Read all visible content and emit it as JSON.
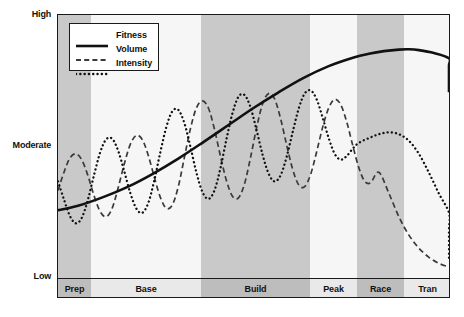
{
  "chart_data": {
    "type": "line",
    "title": "",
    "xlabel": "",
    "ylabel": "",
    "grid": false,
    "legend_position": "top-left",
    "y_ticks": [
      "High",
      "Moderate",
      "Low"
    ],
    "y_tick_positions": [
      1.0,
      0.5,
      0.0
    ],
    "ylim": [
      0,
      1
    ],
    "categories": [
      "Prep",
      "Base",
      "Build",
      "Peak",
      "Race",
      "Tran"
    ],
    "category_spans": [
      [
        0,
        33
      ],
      [
        33,
        143
      ],
      [
        143,
        252
      ],
      [
        252,
        299
      ],
      [
        299,
        346
      ],
      [
        346,
        393
      ]
    ],
    "category_shading": [
      "dark",
      "light",
      "dark",
      "light",
      "dark",
      "light"
    ],
    "series": [
      {
        "name": "Fitness",
        "style": "solid",
        "points": [
          [
            0,
            0.255
          ],
          [
            20,
            0.272
          ],
          [
            45,
            0.305
          ],
          [
            70,
            0.345
          ],
          [
            95,
            0.395
          ],
          [
            120,
            0.452
          ],
          [
            145,
            0.515
          ],
          [
            170,
            0.58
          ],
          [
            195,
            0.645
          ],
          [
            220,
            0.705
          ],
          [
            245,
            0.76
          ],
          [
            270,
            0.805
          ],
          [
            295,
            0.838
          ],
          [
            310,
            0.852
          ],
          [
            325,
            0.862
          ],
          [
            340,
            0.868
          ],
          [
            350,
            0.869
          ],
          [
            360,
            0.866
          ],
          [
            375,
            0.855
          ],
          [
            390,
            0.835
          ],
          [
            405,
            0.808
          ],
          [
            420,
            0.775
          ],
          [
            435,
            0.74
          ],
          [
            450,
            0.705
          ]
        ]
      },
      {
        "name": "Volume",
        "style": "dashed",
        "points": [
          [
            0,
            0.33
          ],
          [
            6,
            0.4
          ],
          [
            12,
            0.455
          ],
          [
            18,
            0.47
          ],
          [
            24,
            0.445
          ],
          [
            30,
            0.385
          ],
          [
            36,
            0.31
          ],
          [
            42,
            0.25
          ],
          [
            48,
            0.23
          ],
          [
            54,
            0.262
          ],
          [
            60,
            0.34
          ],
          [
            66,
            0.43
          ],
          [
            72,
            0.505
          ],
          [
            78,
            0.54
          ],
          [
            84,
            0.525
          ],
          [
            90,
            0.465
          ],
          [
            96,
            0.382
          ],
          [
            102,
            0.305
          ],
          [
            108,
            0.262
          ],
          [
            114,
            0.275
          ],
          [
            120,
            0.345
          ],
          [
            126,
            0.455
          ],
          [
            132,
            0.565
          ],
          [
            138,
            0.645
          ],
          [
            144,
            0.672
          ],
          [
            150,
            0.645
          ],
          [
            156,
            0.565
          ],
          [
            162,
            0.462
          ],
          [
            168,
            0.368
          ],
          [
            174,
            0.308
          ],
          [
            180,
            0.302
          ],
          [
            186,
            0.355
          ],
          [
            192,
            0.455
          ],
          [
            198,
            0.568
          ],
          [
            204,
            0.66
          ],
          [
            210,
            0.7
          ],
          [
            216,
            0.68
          ],
          [
            222,
            0.605
          ],
          [
            228,
            0.505
          ],
          [
            234,
            0.412
          ],
          [
            240,
            0.352
          ],
          [
            246,
            0.345
          ],
          [
            252,
            0.392
          ],
          [
            258,
            0.478
          ],
          [
            264,
            0.572
          ],
          [
            270,
            0.645
          ],
          [
            276,
            0.678
          ],
          [
            282,
            0.658
          ],
          [
            288,
            0.592
          ],
          [
            294,
            0.502
          ],
          [
            300,
            0.418
          ],
          [
            306,
            0.365
          ],
          [
            312,
            0.36
          ],
          [
            320,
            0.4
          ],
          [
            330,
            0.32
          ],
          [
            340,
            0.23
          ],
          [
            350,
            0.16
          ],
          [
            360,
            0.11
          ],
          [
            370,
            0.075
          ],
          [
            380,
            0.052
          ],
          [
            390,
            0.038
          ]
        ]
      },
      {
        "name": "Intensity",
        "style": "dotted",
        "points": [
          [
            0,
            0.365
          ],
          [
            6,
            0.295
          ],
          [
            12,
            0.232
          ],
          [
            18,
            0.205
          ],
          [
            24,
            0.228
          ],
          [
            30,
            0.298
          ],
          [
            36,
            0.39
          ],
          [
            42,
            0.475
          ],
          [
            48,
            0.525
          ],
          [
            54,
            0.528
          ],
          [
            60,
            0.482
          ],
          [
            66,
            0.405
          ],
          [
            72,
            0.322
          ],
          [
            78,
            0.262
          ],
          [
            84,
            0.245
          ],
          [
            90,
            0.282
          ],
          [
            96,
            0.368
          ],
          [
            102,
            0.475
          ],
          [
            108,
            0.572
          ],
          [
            114,
            0.632
          ],
          [
            120,
            0.638
          ],
          [
            126,
            0.588
          ],
          [
            132,
            0.498
          ],
          [
            138,
            0.4
          ],
          [
            144,
            0.325
          ],
          [
            150,
            0.298
          ],
          [
            156,
            0.33
          ],
          [
            162,
            0.415
          ],
          [
            168,
            0.525
          ],
          [
            174,
            0.625
          ],
          [
            180,
            0.688
          ],
          [
            186,
            0.695
          ],
          [
            192,
            0.648
          ],
          [
            198,
            0.562
          ],
          [
            204,
            0.468
          ],
          [
            210,
            0.395
          ],
          [
            216,
            0.365
          ],
          [
            222,
            0.388
          ],
          [
            228,
            0.458
          ],
          [
            234,
            0.552
          ],
          [
            240,
            0.642
          ],
          [
            246,
            0.7
          ],
          [
            252,
            0.712
          ],
          [
            258,
            0.678
          ],
          [
            264,
            0.608
          ],
          [
            270,
            0.53
          ],
          [
            276,
            0.47
          ],
          [
            282,
            0.448
          ],
          [
            288,
            0.462
          ],
          [
            294,
            0.49
          ],
          [
            300,
            0.512
          ],
          [
            310,
            0.53
          ],
          [
            320,
            0.545
          ],
          [
            330,
            0.552
          ],
          [
            340,
            0.545
          ],
          [
            350,
            0.52
          ],
          [
            360,
            0.47
          ],
          [
            370,
            0.398
          ],
          [
            380,
            0.318
          ],
          [
            390,
            0.245
          ],
          [
            400,
            0.185
          ],
          [
            410,
            0.138
          ],
          [
            420,
            0.105
          ],
          [
            430,
            0.082
          ],
          [
            440,
            0.068
          ]
        ]
      }
    ],
    "colors": {
      "fitness_line": "#111111",
      "volume_line": "#3a3a3a",
      "intensity_line": "#111111",
      "band_dark": "#c9c9c9",
      "band_light": "#f6f6f6",
      "footer_dark": "#bdbdbd",
      "footer_light": "#e9e9e9",
      "frame": "#1a1a1a"
    }
  },
  "axis": {
    "high_label": "High",
    "moderate_label": "Moderate",
    "low_label": "Low"
  },
  "legend": {
    "items": [
      {
        "label": "Fitness",
        "style": "solid"
      },
      {
        "label": "Volume",
        "style": "dashed"
      },
      {
        "label": "Intensity",
        "style": "dotted"
      }
    ]
  },
  "phases": [
    {
      "label": "Prep"
    },
    {
      "label": "Base"
    },
    {
      "label": "Build"
    },
    {
      "label": "Peak"
    },
    {
      "label": "Race"
    },
    {
      "label": "Tran"
    }
  ]
}
